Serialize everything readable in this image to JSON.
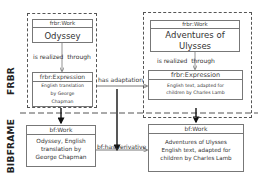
{
  "layers": {
    "top": "FRBR",
    "bottom": "BIBFRAME"
  },
  "frbr": {
    "left_work": {
      "type": "frbr:Work",
      "title": "Odyssey"
    },
    "left_realized": {
      "word1": "is realized",
      "word2": "through"
    },
    "left_expression": {
      "type": "frbr:Expression",
      "text": "English translation by George Chapman"
    },
    "right_work": {
      "type": "frbr:Work",
      "title": "Adventures of Ulysses"
    },
    "right_realized": {
      "word1": "is realized",
      "word2": "through"
    },
    "right_expression": {
      "type": "frbr:Expression",
      "text": "English text, adapted for children by Charles Lamb"
    },
    "relation": "has adaptation"
  },
  "bibframe": {
    "left_work": {
      "type": "bf:Work",
      "text": "Odyssey, English translation by George Chapman"
    },
    "right_work": {
      "type": "bf:Work",
      "text": "Adventures of Ulysses English text, adapted for children by Charles Lamb"
    },
    "relation": "bf:hasDerivative"
  },
  "colors": {
    "line": "#555555",
    "arrow": "#111111",
    "box_border": "#777777"
  }
}
